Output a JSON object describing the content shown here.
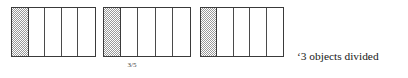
{
  "figure": {
    "name": "division-sharing-diagram",
    "bars": [
      {
        "name": "object-1",
        "segments": 5,
        "shaded_segments": 1,
        "shade_pattern": "checkerboard-dither",
        "shade_color": "#9a9a9a",
        "border_color": "#3a3a3a",
        "fill_color": "#ffffff"
      },
      {
        "name": "object-2",
        "segments": 5,
        "shaded_segments": 1,
        "shade_pattern": "checkerboard-dither",
        "shade_color": "#9a9a9a",
        "border_color": "#3a3a3a",
        "fill_color": "#ffffff"
      },
      {
        "name": "object-3",
        "segments": 5,
        "shaded_segments": 1,
        "shade_pattern": "checkerboard-dither",
        "shade_color": "#9a9a9a",
        "border_color": "#3a3a3a",
        "fill_color": "#ffffff"
      }
    ],
    "fraction_label": "3/5",
    "caption": {
      "line_1": "‘3 objects divided",
      "line_2": "between 5 people.’"
    }
  }
}
